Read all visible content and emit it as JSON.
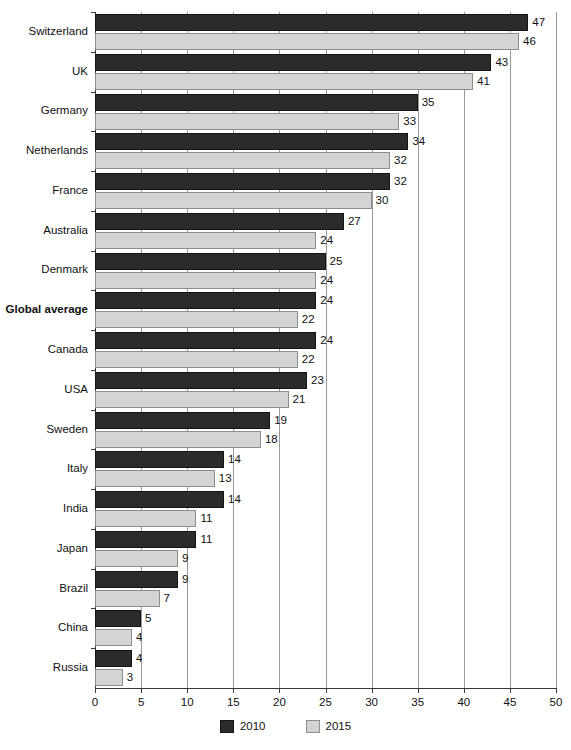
{
  "chart_data": {
    "type": "bar",
    "orientation": "horizontal",
    "title": "",
    "xlabel": "",
    "ylabel": "",
    "xlim": [
      0,
      50
    ],
    "xticks": [
      0,
      5,
      10,
      15,
      20,
      25,
      30,
      35,
      40,
      45,
      50
    ],
    "grid": true,
    "grid_axis": "x",
    "legend_position": "bottom-center",
    "categories": [
      "Switzerland",
      "UK",
      "Germany",
      "Netherlands",
      "France",
      "Australia",
      "Denmark",
      "Global average",
      "Canada",
      "USA",
      "Sweden",
      "Italy",
      "India",
      "Japan",
      "Brazil",
      "China",
      "Russia"
    ],
    "highlight_category": "Global average",
    "series": [
      {
        "name": "2010",
        "color": "#2b2b2b",
        "values": [
          47,
          43,
          35,
          34,
          32,
          27,
          25,
          24,
          24,
          23,
          19,
          14,
          14,
          11,
          9,
          5,
          4
        ]
      },
      {
        "name": "2015",
        "color": "#d4d4d4",
        "values": [
          46,
          41,
          33,
          32,
          30,
          24,
          24,
          22,
          22,
          21,
          18,
          13,
          11,
          9,
          7,
          4,
          3
        ]
      }
    ]
  },
  "legend": {
    "items": [
      {
        "label": "2010",
        "swatch": "dark"
      },
      {
        "label": "2015",
        "swatch": "light"
      }
    ]
  },
  "caption": {
    "text": ""
  },
  "colors": {
    "series_2010": "#2b2b2b",
    "series_2015": "#d4d4d4",
    "axis": "#3a3a3a",
    "gridline": "#9a9a9a",
    "background": "#ffffff"
  }
}
